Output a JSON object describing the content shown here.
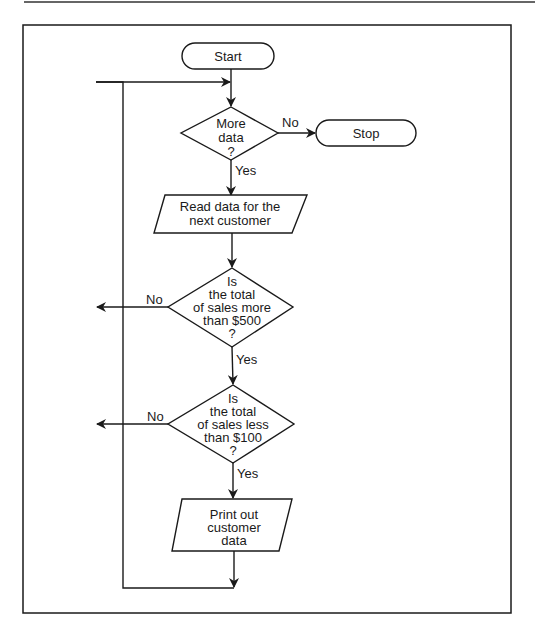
{
  "flowchart": {
    "start": "Start",
    "stop": "Stop",
    "decision_more_data": [
      "More",
      "data",
      "?"
    ],
    "read_data": [
      "Read data for the",
      "next customer"
    ],
    "decision_more_500": [
      "Is",
      "the total",
      "of sales more",
      "than $500",
      "?"
    ],
    "decision_less_100": [
      "Is",
      "the total",
      "of sales less",
      "than $100",
      "?"
    ],
    "print_out": [
      "Print out",
      "customer",
      "data"
    ],
    "labels": {
      "no_stop": "No",
      "yes_read": "Yes",
      "no_500": "No",
      "yes_500": "Yes",
      "no_100": "No",
      "yes_100": "Yes"
    }
  },
  "colors": {
    "line": "#1a1a1a",
    "background": "#ffffff"
  }
}
